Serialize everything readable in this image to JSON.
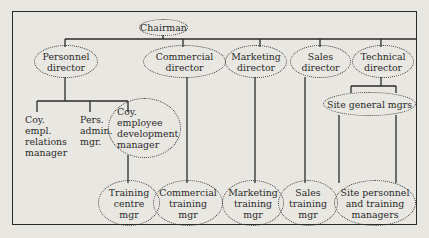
{
  "diagram": {
    "type": "organization-chart",
    "root": {
      "id": "chairman",
      "label": "Chairman"
    },
    "directors": [
      {
        "id": "personnel-director",
        "label": "Personnel\ndirector"
      },
      {
        "id": "commercial-director",
        "label": "Commercial\ndirector"
      },
      {
        "id": "marketing-director",
        "label": "Marketing\ndirector"
      },
      {
        "id": "sales-director",
        "label": "Sales\ndirector"
      },
      {
        "id": "technical-director",
        "label": "Technical\ndirector"
      }
    ],
    "personnel_reports": [
      {
        "id": "coy-empl-relations-manager",
        "label": "Coy.\nempl.\nrelations\nmanager"
      },
      {
        "id": "pers-admin-mgr",
        "label": "Pers.\nadmin.\nmgr."
      },
      {
        "id": "coy-employee-development-manager",
        "label": "Coy.\nemployee\ndevelopment\nmanager"
      }
    ],
    "technical_reports": [
      {
        "id": "site-general-mgrs",
        "label": "Site general mgrs"
      }
    ],
    "training_managers": [
      {
        "id": "training-centre-mgr",
        "label": "Training\ncentre\nmgr"
      },
      {
        "id": "commercial-training-mgr",
        "label": "Commercial\ntraining\nmgr"
      },
      {
        "id": "marketing-training-mgr",
        "label": "Marketing\ntraining\nmgr"
      },
      {
        "id": "sales-training-mgr",
        "label": "Sales\ntraining\nmgr"
      },
      {
        "id": "site-personnel-and-training-managers",
        "label": "Site personnel\nand training\nmanagers"
      }
    ],
    "edges": [
      [
        "chairman",
        "personnel-director"
      ],
      [
        "chairman",
        "commercial-director"
      ],
      [
        "chairman",
        "marketing-director"
      ],
      [
        "chairman",
        "sales-director"
      ],
      [
        "chairman",
        "technical-director"
      ],
      [
        "personnel-director",
        "coy-empl-relations-manager"
      ],
      [
        "personnel-director",
        "pers-admin-mgr"
      ],
      [
        "personnel-director",
        "coy-employee-development-manager"
      ],
      [
        "coy-employee-development-manager",
        "training-centre-mgr"
      ],
      [
        "commercial-director",
        "commercial-training-mgr"
      ],
      [
        "marketing-director",
        "marketing-training-mgr"
      ],
      [
        "sales-director",
        "sales-training-mgr"
      ],
      [
        "technical-director",
        "site-general-mgrs"
      ],
      [
        "site-general-mgrs",
        "site-personnel-and-training-managers"
      ]
    ]
  }
}
